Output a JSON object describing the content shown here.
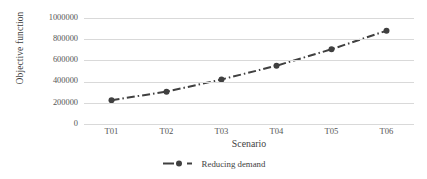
{
  "chart_data": {
    "type": "line",
    "title": "",
    "xlabel": "Scenario",
    "ylabel": "Objective function",
    "categories": [
      "T01",
      "T02",
      "T03",
      "T04",
      "T05",
      "T06"
    ],
    "series": [
      {
        "name": "Reducing demand",
        "values": [
          225000,
          305000,
          420000,
          550000,
          705000,
          880000
        ],
        "color": "#404040",
        "line_style": "dash-dot",
        "marker": "circle"
      }
    ],
    "ylim": [
      0,
      1000000
    ],
    "yticks": [
      0,
      200000,
      400000,
      600000,
      800000,
      1000000
    ],
    "ytick_labels": [
      "0",
      "200000",
      "400000",
      "600000",
      "800000",
      "1000000"
    ],
    "grid": "horizontal",
    "legend_position": "bottom"
  },
  "axes": {
    "y_title": "Objective function",
    "x_title": "Scenario"
  },
  "legend": {
    "entries": [
      {
        "label": "Reducing demand",
        "color": "#404040"
      }
    ]
  },
  "colors": {
    "series": "#404040",
    "gridline": "#d9d9d9",
    "text": "#3f3f3f",
    "tick_text": "#555555",
    "background": "#ffffff"
  }
}
